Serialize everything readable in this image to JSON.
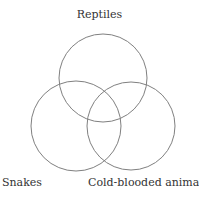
{
  "diagram": {
    "type": "venn",
    "sets": [
      {
        "label": "Reptiles",
        "cx": 103,
        "cy": 78,
        "r": 44
      },
      {
        "label": "Snakes",
        "cx": 76,
        "cy": 126,
        "r": 45
      },
      {
        "label": "Cold-blooded animals",
        "cx": 131,
        "cy": 126,
        "r": 44
      }
    ],
    "stroke_color": "#808080",
    "text_color": "#333333"
  }
}
